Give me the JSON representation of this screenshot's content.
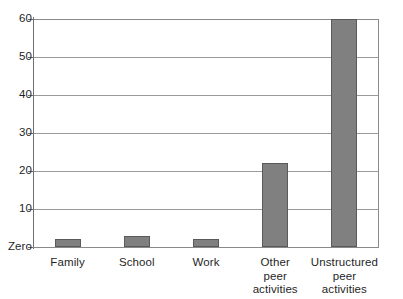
{
  "chart_data": {
    "type": "bar",
    "title": "",
    "subtitle": "",
    "xlabel": "",
    "ylabel": "",
    "categories": [
      "Family",
      "School",
      "Work",
      "Other peer activities",
      "Unstructured peer activities"
    ],
    "category_label_lines": [
      [
        "Family"
      ],
      [
        "School"
      ],
      [
        "Work"
      ],
      [
        "Other",
        "peer",
        "activities"
      ],
      [
        "Unstructured",
        "peer activities"
      ]
    ],
    "values": [
      2,
      3,
      2,
      22,
      60
    ],
    "ylim": [
      0,
      60
    ],
    "y_ticks": [
      0,
      10,
      20,
      30,
      40,
      50,
      60
    ],
    "y_tick_labels": [
      "Zero",
      "10",
      "20",
      "30",
      "40",
      "50",
      "60"
    ],
    "grid": true,
    "grid_axis": "y",
    "legend": null,
    "legend_position": "none",
    "annotations": [],
    "bar_color": "#808080",
    "bar_border_color": "#5a5a5a",
    "gridline_color": "#9a9a9a",
    "axis_color": "#6f6f6f",
    "background_color": "#ffffff"
  }
}
